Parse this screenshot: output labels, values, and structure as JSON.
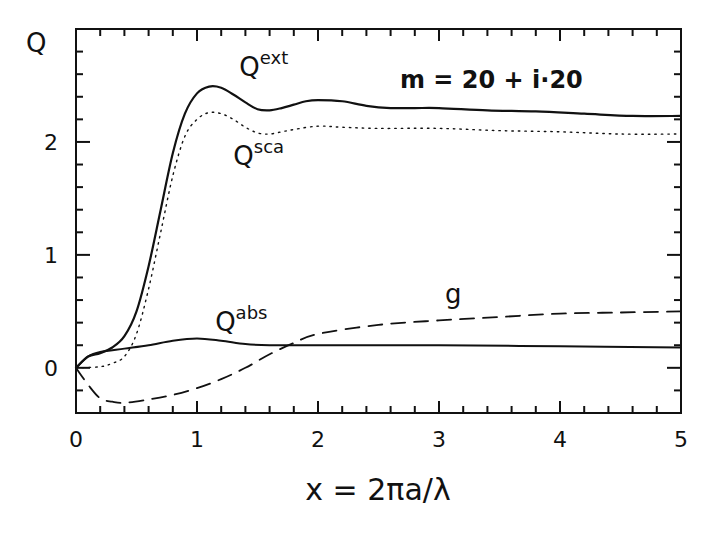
{
  "chart_data": {
    "type": "line",
    "title": "",
    "annotation": "m = 20 + i·20",
    "xlabel": "x = 2πa/λ",
    "ylabel": "Q",
    "xlim": [
      0,
      5
    ],
    "ylim": [
      -0.4,
      3.0
    ],
    "x_ticks": [
      0,
      1,
      2,
      3,
      4,
      5
    ],
    "x_tick_labels": [
      "0",
      "1",
      "2",
      "3",
      "4",
      "5"
    ],
    "x_minor_step": 0.2,
    "y_ticks": [
      0,
      1,
      2
    ],
    "y_tick_labels": [
      "0",
      "1",
      "2"
    ],
    "y_minor_step": 0.2,
    "grid": false,
    "legend": "inline labels",
    "series": [
      {
        "name": "Q^ext",
        "label_base": "Q",
        "label_sup": "ext",
        "style": "solid",
        "width": 2.2,
        "x": [
          0,
          0.1,
          0.2,
          0.3,
          0.4,
          0.5,
          0.6,
          0.7,
          0.8,
          0.9,
          1.0,
          1.1,
          1.2,
          1.3,
          1.4,
          1.5,
          1.6,
          1.7,
          1.8,
          1.9,
          2.0,
          2.2,
          2.4,
          2.6,
          2.8,
          3.0,
          3.4,
          3.8,
          4.2,
          4.6,
          5.0
        ],
        "values": [
          0,
          0.1,
          0.13,
          0.18,
          0.28,
          0.5,
          0.9,
          1.4,
          1.9,
          2.25,
          2.43,
          2.49,
          2.48,
          2.42,
          2.35,
          2.29,
          2.28,
          2.3,
          2.33,
          2.36,
          2.37,
          2.36,
          2.32,
          2.3,
          2.3,
          2.3,
          2.28,
          2.27,
          2.25,
          2.23,
          2.23
        ]
      },
      {
        "name": "Q^sca",
        "label_base": "Q",
        "label_sup": "sca",
        "style": "dotted",
        "width": 1.4,
        "x": [
          0,
          0.2,
          0.3,
          0.4,
          0.5,
          0.6,
          0.7,
          0.8,
          0.9,
          1.0,
          1.1,
          1.2,
          1.3,
          1.4,
          1.5,
          1.6,
          1.7,
          1.8,
          2.0,
          2.2,
          2.5,
          3.0,
          3.5,
          4.0,
          4.5,
          5.0
        ],
        "values": [
          0,
          0.01,
          0.04,
          0.1,
          0.3,
          0.7,
          1.2,
          1.7,
          2.05,
          2.2,
          2.26,
          2.25,
          2.2,
          2.13,
          2.08,
          2.07,
          2.09,
          2.11,
          2.14,
          2.13,
          2.12,
          2.12,
          2.1,
          2.09,
          2.07,
          2.07
        ]
      },
      {
        "name": "Q^abs",
        "label_base": "Q",
        "label_sup": "abs",
        "style": "solid",
        "width": 2,
        "x": [
          0,
          0.1,
          0.2,
          0.4,
          0.6,
          0.8,
          1.0,
          1.2,
          1.4,
          1.6,
          2.0,
          3.0,
          4.0,
          5.0
        ],
        "values": [
          0,
          0.1,
          0.14,
          0.17,
          0.2,
          0.24,
          0.26,
          0.24,
          0.21,
          0.2,
          0.2,
          0.2,
          0.19,
          0.18
        ]
      },
      {
        "name": "g",
        "label_base": "g",
        "label_sup": "",
        "style": "dashed",
        "width": 1.8,
        "x": [
          0,
          0.1,
          0.2,
          0.3,
          0.4,
          0.6,
          0.8,
          1.0,
          1.2,
          1.4,
          1.6,
          1.8,
          2.0,
          2.5,
          3.0,
          3.5,
          4.0,
          4.5,
          5.0
        ],
        "values": [
          0,
          -0.15,
          -0.27,
          -0.3,
          -0.31,
          -0.28,
          -0.24,
          -0.18,
          -0.1,
          0.0,
          0.12,
          0.22,
          0.3,
          0.38,
          0.42,
          0.45,
          0.48,
          0.49,
          0.5
        ]
      }
    ],
    "label_positions": {
      "Q^ext": [
        1.35,
        2.58
      ],
      "Q^sca": [
        1.3,
        1.8
      ],
      "Q^abs": [
        1.15,
        0.33
      ],
      "g": [
        3.05,
        0.57
      ]
    }
  },
  "colors": {
    "ink": "#111111",
    "background": "#ffffff"
  }
}
